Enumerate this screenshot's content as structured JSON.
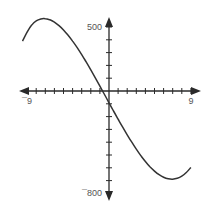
{
  "chart_data": {
    "type": "line",
    "title": "",
    "xlabel": "",
    "ylabel": "",
    "xlim": [
      -9.5,
      10
    ],
    "ylim": [
      -850,
      570
    ],
    "grid": false,
    "x_tick_step": 1,
    "y_tick_step": 100,
    "x_tick_labels": [
      {
        "value": -9,
        "label": "¯9"
      },
      {
        "value": 9,
        "label": "9"
      }
    ],
    "y_tick_labels": [
      {
        "value": 500,
        "label": "500"
      },
      {
        "value": -800,
        "label": "¯800"
      }
    ],
    "series": [
      {
        "name": "curve",
        "color": "#333333",
        "x": [
          -9.5,
          -9,
          -8.5,
          -8,
          -7.5,
          -7,
          -6.5,
          -6,
          -5.5,
          -5,
          -4.5,
          -4,
          -3.5,
          -3,
          -2.5,
          -2,
          -1.5,
          -1,
          -0.5,
          0,
          0.5,
          1,
          1.5,
          2,
          2.5,
          3,
          3.5,
          4,
          4.5,
          5,
          5.5,
          6,
          6.5,
          7,
          7.5,
          8,
          8.5,
          9
        ],
        "y": [
          390,
          460,
          515,
          548,
          563,
          565,
          556,
          538,
          511,
          477,
          436,
          390,
          339,
          284,
          226,
          165,
          102,
          38,
          -27,
          -92,
          -156,
          -220,
          -282,
          -342,
          -400,
          -455,
          -505,
          -551,
          -592,
          -626,
          -654,
          -674,
          -686,
          -689,
          -682,
          -665,
          -637,
          -597
        ]
      }
    ]
  }
}
